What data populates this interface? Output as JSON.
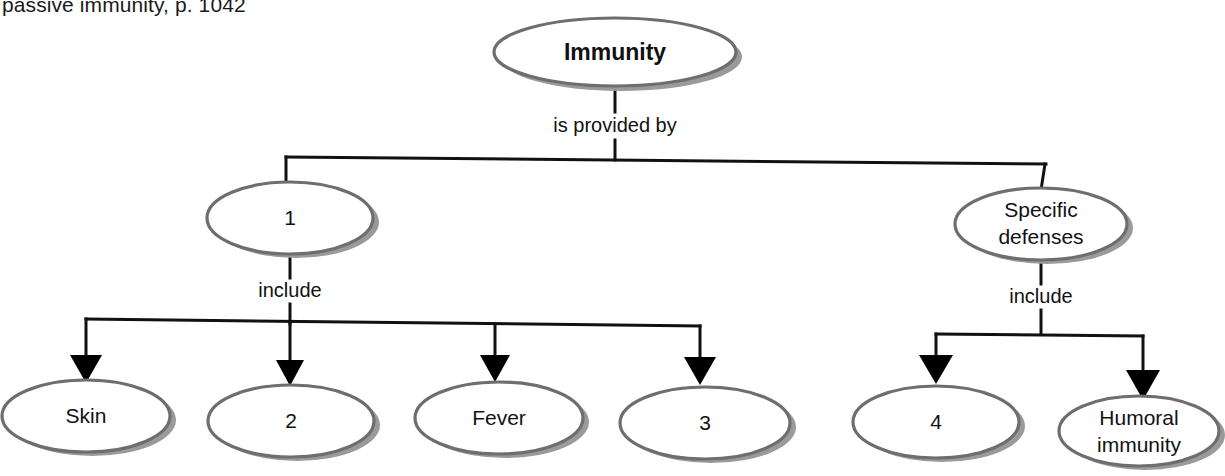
{
  "page_reference": "passive immunity, p. 1042",
  "diagram": {
    "type": "concept-map",
    "root": {
      "id": "immunity",
      "label": "Immunity",
      "bold": true
    },
    "link_labels": {
      "root_to_level1": "is provided by",
      "left_to_children": "include",
      "right_to_children": "include"
    },
    "level1": [
      {
        "id": "node-1",
        "label": "1",
        "blank": true
      },
      {
        "id": "specific-defenses",
        "label_line1": "Specific",
        "label_line2": "defenses",
        "blank": false
      }
    ],
    "level2_left": [
      {
        "id": "skin",
        "label": "Skin",
        "blank": false
      },
      {
        "id": "node-2",
        "label": "2",
        "blank": true
      },
      {
        "id": "fever",
        "label": "Fever",
        "blank": false
      },
      {
        "id": "node-3",
        "label": "3",
        "blank": true
      }
    ],
    "level2_right": [
      {
        "id": "node-4",
        "label": "4",
        "blank": true
      },
      {
        "id": "humoral-immunity",
        "label_line1": "Humoral",
        "label_line2": "immunity",
        "blank": false
      }
    ],
    "colors": {
      "outline": "#6e6e6e",
      "shadow": "#9a9a9a",
      "connector": "#111111",
      "text": "#111111",
      "background": "#ffffff"
    }
  }
}
